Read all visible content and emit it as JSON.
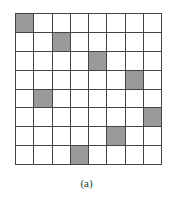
{
  "figure": {
    "caption": "(a)",
    "rows": 8,
    "cols": 8,
    "shaded_color": "#9a9a9a",
    "shaded_cells": [
      {
        "row": 0,
        "col": 0
      },
      {
        "row": 1,
        "col": 2
      },
      {
        "row": 2,
        "col": 4
      },
      {
        "row": 3,
        "col": 6
      },
      {
        "row": 4,
        "col": 1
      },
      {
        "row": 5,
        "col": 7
      },
      {
        "row": 6,
        "col": 5
      },
      {
        "row": 7,
        "col": 3
      }
    ]
  }
}
